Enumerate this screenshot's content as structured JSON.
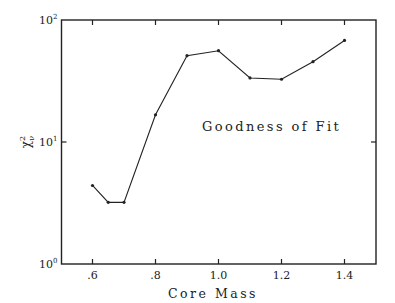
{
  "chart_data": {
    "type": "line",
    "title": "",
    "annotation": "Goodness of Fit",
    "xlabel": "Core Mass",
    "ylabel": "χ²ν",
    "x": [
      0.6,
      0.65,
      0.7,
      0.8,
      0.9,
      1.0,
      1.1,
      1.2,
      1.3,
      1.4
    ],
    "values": [
      4.4,
      3.2,
      3.2,
      16.7,
      51,
      56,
      33.5,
      32.7,
      45.5,
      68
    ],
    "xlim": [
      0.45,
      1.55
    ],
    "ylim": [
      1,
      100
    ],
    "yscale": "log",
    "x_ticks": [
      0.6,
      0.8,
      1.0,
      1.2,
      1.4
    ],
    "x_tick_labels": [
      ".6",
      ".8",
      "1.0",
      "1.2",
      "1.4"
    ],
    "y_ticks": [
      1,
      10,
      100
    ],
    "y_tick_labels": [
      {
        "base": "10",
        "exp": "0"
      },
      {
        "base": "10",
        "exp": "1"
      },
      {
        "base": "10",
        "exp": "2"
      }
    ],
    "grid": false,
    "legend": null,
    "line_color": "#222222",
    "marker": "dot"
  }
}
